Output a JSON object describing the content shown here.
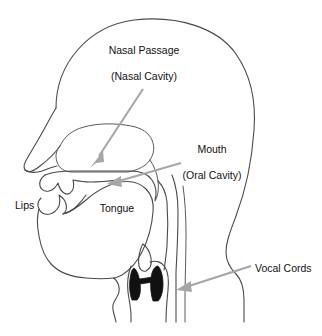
{
  "diagram": {
    "canvas": {
      "width": 322,
      "height": 336
    },
    "colors": {
      "background": "#ffffff",
      "outline": "#4a4a4a",
      "arrow": "#a6a6a6",
      "vocal_cords": "#111111",
      "text": "#111111"
    },
    "labels": [
      {
        "id": "nasal-passage",
        "text": "Nasal Passage",
        "x": 144,
        "y": 51,
        "anchor": "center",
        "has_arrow": true
      },
      {
        "id": "nasal-cavity",
        "text": "(Nasal Cavity)",
        "x": 144,
        "y": 77,
        "anchor": "center",
        "has_arrow": false
      },
      {
        "id": "mouth",
        "text": "Mouth",
        "x": 212,
        "y": 150,
        "anchor": "center",
        "has_arrow": true
      },
      {
        "id": "oral-cavity",
        "text": "(Oral Cavity)",
        "x": 212,
        "y": 176,
        "anchor": "center",
        "has_arrow": false
      },
      {
        "id": "lips",
        "text": "Lips",
        "x": 15,
        "y": 206,
        "anchor": "start",
        "has_arrow": false
      },
      {
        "id": "tongue",
        "text": "Tongue",
        "x": 117,
        "y": 209,
        "anchor": "center",
        "has_arrow": false
      },
      {
        "id": "vocal-cords",
        "text": "Vocal Cords",
        "x": 255,
        "y": 269,
        "anchor": "start",
        "has_arrow": true
      }
    ],
    "arrows": [
      {
        "id": "arrow-nasal-cavity",
        "label_id": "nasal-cavity",
        "from": {
          "x": 143,
          "y": 89
        },
        "to": {
          "x": 92,
          "y": 163
        },
        "direction": "down-left"
      },
      {
        "id": "arrow-oral-cavity",
        "label_id": "oral-cavity",
        "from": {
          "x": 180,
          "y": 163
        },
        "to": {
          "x": 110,
          "y": 183
        },
        "direction": "down-left"
      },
      {
        "id": "arrow-vocal-cords",
        "label_id": "vocal-cords",
        "from": {
          "x": 250,
          "y": 266
        },
        "to": {
          "x": 176,
          "y": 290
        },
        "direction": "down-left"
      }
    ],
    "anatomy_parts": [
      {
        "id": "head-outline",
        "name": "head-and-neck-profile"
      },
      {
        "id": "nose-profile",
        "name": "nose"
      },
      {
        "id": "nasal-cavity-region",
        "name": "nasal-cavity"
      },
      {
        "id": "hard-palate",
        "name": "hard-palate"
      },
      {
        "id": "velum",
        "name": "soft-palate-velum"
      },
      {
        "id": "upper-lip-teeth",
        "name": "upper-lip-and-teeth"
      },
      {
        "id": "lower-lip-teeth",
        "name": "lower-lip-and-teeth"
      },
      {
        "id": "tongue-body",
        "name": "tongue"
      },
      {
        "id": "pharynx",
        "name": "pharyngeal-wall"
      },
      {
        "id": "epiglottis",
        "name": "epiglottis"
      },
      {
        "id": "larynx",
        "name": "larynx"
      },
      {
        "id": "vocal-cords-glyph",
        "name": "vocal-cords"
      },
      {
        "id": "trachea",
        "name": "trachea"
      },
      {
        "id": "spine-line",
        "name": "spinal-column"
      }
    ]
  }
}
